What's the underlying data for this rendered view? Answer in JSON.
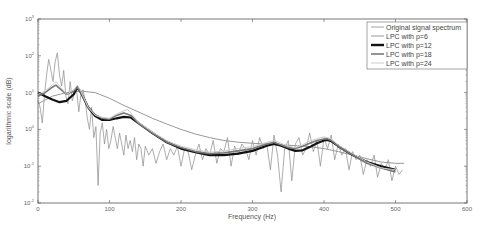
{
  "chart_data": {
    "type": "line",
    "title": "",
    "xlabel": "Frequency (Hz)",
    "ylabel": "logarithmic scale (dB)",
    "xlim": [
      0,
      600
    ],
    "ylim": [
      0.01,
      1000
    ],
    "yscale": "log",
    "grid": false,
    "legend_position": "upper right",
    "x_ticks": [
      0,
      100,
      200,
      300,
      400,
      500,
      600
    ],
    "x_tick_labels": [
      "0",
      "100",
      "200",
      "300",
      "400",
      "500",
      "600"
    ],
    "y_ticks": [
      0.01,
      0.1,
      1,
      10,
      100,
      1000
    ],
    "y_tick_labels": [
      {
        "base": "10",
        "exp": "-2"
      },
      {
        "base": "10",
        "exp": "-1"
      },
      {
        "base": "10",
        "exp": "0"
      },
      {
        "base": "10",
        "exp": "1"
      },
      {
        "base": "10",
        "exp": "2"
      },
      {
        "base": "10",
        "exp": "3"
      }
    ],
    "series": [
      {
        "name": "Original signal spectrum",
        "color": "#8a8a8a",
        "width": 0.7,
        "x": [
          0,
          3,
          6,
          9,
          12,
          15,
          18,
          21,
          24,
          27,
          30,
          33,
          36,
          39,
          42,
          45,
          48,
          51,
          54,
          57,
          60,
          63,
          66,
          69,
          72,
          75,
          78,
          81,
          84,
          87,
          90,
          93,
          96,
          99,
          102,
          105,
          108,
          111,
          114,
          117,
          120,
          123,
          126,
          129,
          132,
          135,
          138,
          141,
          144,
          147,
          150,
          155,
          160,
          165,
          170,
          175,
          180,
          185,
          190,
          195,
          200,
          205,
          210,
          215,
          220,
          225,
          230,
          235,
          240,
          245,
          250,
          255,
          260,
          265,
          270,
          275,
          280,
          285,
          290,
          295,
          300,
          305,
          310,
          315,
          320,
          325,
          330,
          335,
          340,
          345,
          350,
          355,
          360,
          365,
          370,
          375,
          380,
          385,
          390,
          395,
          400,
          405,
          410,
          415,
          420,
          425,
          430,
          435,
          440,
          445,
          450,
          455,
          460,
          465,
          470,
          475,
          480,
          485,
          490,
          495,
          500,
          505,
          510
        ],
        "y": [
          6,
          4,
          1.5,
          8,
          30,
          80,
          40,
          20,
          70,
          120,
          30,
          15,
          40,
          8,
          5,
          20,
          6,
          10,
          12,
          3,
          9,
          12,
          6,
          2,
          1,
          4,
          0.6,
          1.2,
          0.03,
          0.8,
          1.5,
          0.4,
          1.0,
          0.3,
          0.5,
          1.2,
          0.6,
          0.3,
          0.8,
          0.4,
          0.2,
          0.7,
          0.3,
          0.5,
          0.25,
          0.6,
          0.15,
          0.4,
          0.3,
          0.1,
          0.35,
          0.2,
          0.3,
          0.12,
          0.25,
          0.4,
          0.15,
          0.3,
          0.2,
          0.35,
          0.1,
          0.3,
          0.25,
          0.08,
          0.2,
          0.4,
          0.15,
          0.3,
          0.2,
          0.5,
          0.12,
          0.3,
          0.25,
          0.6,
          0.1,
          0.35,
          0.2,
          0.4,
          0.3,
          0.15,
          0.5,
          0.2,
          0.6,
          0.3,
          0.4,
          0.08,
          0.7,
          0.2,
          0.02,
          0.3,
          0.5,
          0.04,
          0.4,
          0.6,
          0.2,
          0.3,
          0.8,
          0.25,
          0.5,
          0.1,
          0.6,
          0.3,
          0.7,
          0.15,
          0.4,
          0.2,
          0.3,
          0.08,
          0.25,
          0.15,
          0.2,
          0.06,
          0.15,
          0.1,
          0.2,
          0.05,
          0.12,
          0.08,
          0.15,
          0.04,
          0.1,
          0.06,
          0.08
        ]
      },
      {
        "name": "LPC with p=6",
        "color": "#999999",
        "width": 1.0,
        "x": [
          0,
          20,
          40,
          60,
          80,
          100,
          120,
          140,
          160,
          180,
          200,
          220,
          240,
          260,
          280,
          300,
          320,
          340,
          360,
          380,
          400,
          420,
          440,
          460,
          480,
          500,
          512
        ],
        "y": [
          5,
          8,
          10,
          11,
          10,
          7,
          4.5,
          3,
          2,
          1.4,
          1.0,
          0.75,
          0.6,
          0.5,
          0.45,
          0.42,
          0.4,
          0.38,
          0.36,
          0.34,
          0.3,
          0.25,
          0.2,
          0.16,
          0.13,
          0.12,
          0.12
        ]
      },
      {
        "name": "LPC with p=12",
        "color": "#111111",
        "width": 2.2,
        "x": [
          0,
          10,
          20,
          30,
          40,
          50,
          55,
          60,
          70,
          80,
          90,
          100,
          110,
          120,
          130,
          140,
          160,
          180,
          200,
          220,
          240,
          260,
          280,
          300,
          320,
          330,
          340,
          350,
          360,
          370,
          380,
          390,
          400,
          405,
          410,
          420,
          440,
          460,
          480,
          500
        ],
        "y": [
          10,
          8,
          6.5,
          5.5,
          6,
          9,
          14,
          10,
          4,
          2.3,
          1.8,
          1.8,
          2.0,
          2.2,
          2.1,
          1.5,
          0.8,
          0.45,
          0.3,
          0.24,
          0.2,
          0.2,
          0.22,
          0.26,
          0.36,
          0.4,
          0.36,
          0.3,
          0.26,
          0.27,
          0.33,
          0.42,
          0.5,
          0.52,
          0.48,
          0.35,
          0.2,
          0.13,
          0.1,
          0.08
        ]
      },
      {
        "name": "LPC with p=18",
        "color": "#777777",
        "width": 1.6,
        "x": [
          0,
          10,
          20,
          25,
          30,
          40,
          50,
          55,
          60,
          70,
          80,
          90,
          100,
          110,
          120,
          130,
          140,
          160,
          180,
          200,
          220,
          240,
          260,
          280,
          300,
          320,
          330,
          340,
          350,
          360,
          370,
          380,
          390,
          400,
          405,
          410,
          420,
          440,
          460,
          480,
          500
        ],
        "y": [
          8,
          10,
          14,
          16,
          13,
          9,
          11,
          14,
          10,
          4,
          2.5,
          2.0,
          1.9,
          2.4,
          2.8,
          2.4,
          1.5,
          0.8,
          0.45,
          0.32,
          0.25,
          0.22,
          0.23,
          0.26,
          0.3,
          0.4,
          0.45,
          0.38,
          0.32,
          0.3,
          0.35,
          0.42,
          0.5,
          0.55,
          0.56,
          0.5,
          0.35,
          0.2,
          0.12,
          0.09,
          0.07
        ]
      },
      {
        "name": "LPC with p=24",
        "color": "#cccccc",
        "width": 1.0,
        "x": [
          0,
          10,
          20,
          25,
          30,
          40,
          50,
          55,
          60,
          70,
          80,
          90,
          100,
          110,
          120,
          125,
          130,
          140,
          160,
          180,
          200,
          220,
          240,
          260,
          280,
          300,
          320,
          330,
          340,
          350,
          360,
          370,
          380,
          390,
          400,
          405,
          410,
          420,
          440,
          460,
          480,
          500
        ],
        "y": [
          9,
          11,
          16,
          20,
          15,
          9,
          12,
          16,
          11,
          4,
          2.4,
          2.1,
          2.0,
          2.6,
          3.2,
          3.5,
          2.8,
          1.6,
          0.85,
          0.5,
          0.35,
          0.28,
          0.24,
          0.26,
          0.3,
          0.34,
          0.45,
          0.5,
          0.42,
          0.35,
          0.32,
          0.38,
          0.48,
          0.56,
          0.62,
          0.6,
          0.55,
          0.38,
          0.22,
          0.13,
          0.09,
          0.08
        ]
      }
    ]
  },
  "legend": {
    "items": [
      {
        "label": "Original signal spectrum",
        "color": "#8a8a8a",
        "width": 0.8
      },
      {
        "label": "LPC with p=6",
        "color": "#999999",
        "width": 1.0
      },
      {
        "label": "LPC with p=12",
        "color": "#111111",
        "width": 2.4
      },
      {
        "label": "LPC with p=18",
        "color": "#777777",
        "width": 1.6
      },
      {
        "label": "LPC with p=24",
        "color": "#cccccc",
        "width": 1.0
      }
    ]
  }
}
